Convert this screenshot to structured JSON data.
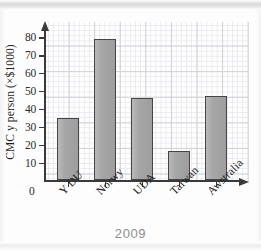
{
  "caption": "2009",
  "chart_data": {
    "type": "bar",
    "title": "",
    "xlabel": "",
    "ylabel": "CMC y person (×$1000)",
    "categories": [
      "Y DU",
      "Norwy",
      "UDA",
      "Taiwan",
      "Awstralia"
    ],
    "values": [
      35,
      79,
      46,
      16.5,
      47
    ],
    "ylim": [
      0,
      85
    ],
    "yticks": [
      0,
      10,
      20,
      30,
      40,
      50,
      60,
      70,
      80
    ],
    "ytick_labels": [
      "0",
      "10",
      "20",
      "30",
      "40",
      "50",
      "60",
      "70",
      "80"
    ],
    "grid": true,
    "legend": null,
    "bar_fill_color": "#a6a6a6",
    "bar_edge_color": "#454545",
    "axis_color": "#3a3a3a",
    "grid_color": "#cfcfd4",
    "caption_color": "#8e8e8e"
  }
}
